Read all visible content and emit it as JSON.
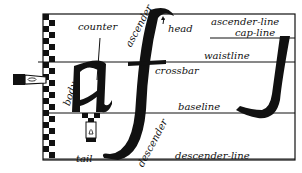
{
  "diagram": {
    "type": "letterform-anatomy",
    "colors": {
      "ink": "#111111",
      "paper": "#ffffff"
    },
    "letters": [
      "a",
      "f",
      "J"
    ],
    "guidelines": [
      {
        "name": "ascender-line",
        "label": "ascender-line"
      },
      {
        "name": "cap-line",
        "label": "cap-line"
      },
      {
        "name": "waistline",
        "label": "waistline"
      },
      {
        "name": "baseline",
        "label": "baseline"
      },
      {
        "name": "descender-line",
        "label": "descender-line"
      }
    ],
    "parts": {
      "counter": "counter",
      "ascender": "ascender",
      "head": "head",
      "crossbar": "crossbar",
      "body": "body",
      "descender": "descender",
      "tail": "tail"
    },
    "icons": [
      "pen-nib-icon",
      "checkered-nib-width-scale"
    ]
  }
}
